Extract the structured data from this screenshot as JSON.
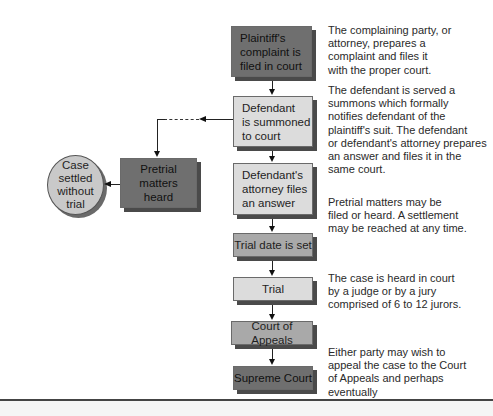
{
  "diagram": {
    "type": "flowchart",
    "nodes": [
      {
        "id": "complaint",
        "label": "Plaintiff's\ncomplaint is\nfiled in court",
        "shade": "dark"
      },
      {
        "id": "summoned",
        "label": "Defendant\nis summoned\nto court",
        "shade": "light"
      },
      {
        "id": "answer",
        "label": "Defendant's\nattorney files\nan answer",
        "shade": "light"
      },
      {
        "id": "trial_date",
        "label": "Trial date is set",
        "shade": "mid"
      },
      {
        "id": "trial",
        "label": "Trial",
        "shade": "light"
      },
      {
        "id": "appeals",
        "label": "Court of Appeals",
        "shade": "mid"
      },
      {
        "id": "supreme",
        "label": "Supreme Court",
        "shade": "dark"
      },
      {
        "id": "pretrial",
        "label": "Pretrial\nmatters\nheard",
        "shade": "dark"
      },
      {
        "id": "settled",
        "label": "Case\nsettled\nwithout\ntrial",
        "shape": "circle"
      }
    ],
    "edges": [
      {
        "from": "complaint",
        "to": "summoned"
      },
      {
        "from": "summoned",
        "to": "answer"
      },
      {
        "from": "answer",
        "to": "trial_date"
      },
      {
        "from": "trial_date",
        "to": "trial"
      },
      {
        "from": "trial",
        "to": "appeals"
      },
      {
        "from": "appeals",
        "to": "supreme"
      },
      {
        "from": "summoned",
        "to": "pretrial",
        "style": "dashed"
      },
      {
        "from": "pretrial",
        "to": "settled"
      }
    ],
    "descriptions": [
      "The complaining party, or\nattorney, prepares a\ncomplaint and files it\nwith the proper court.",
      "The defendant is served a\nsummons which formally\nnotifies defendant of the\nplaintiff's suit. The defendant\nor defendant's attorney prepares\nan answer and files it in the\nsame court.",
      "Pretrial matters may be\nfiled or heard. A settlement\nmay be reached at any time.",
      "The case is heard in court\nby a judge or by a jury\ncomprised of 6 to 12 jurors.",
      "Either party may wish to\nappeal the case to the Court\nof Appeals and perhaps eventually\nto the Supreme Court."
    ]
  }
}
